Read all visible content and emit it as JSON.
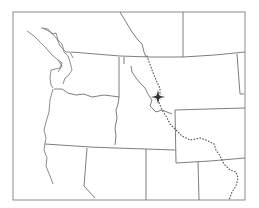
{
  "map": {
    "region": "Pacific Northwest / Northern Rocky Mountains",
    "labels": [],
    "features": {
      "frame": "map-frame",
      "international_border": "canada-us-border",
      "state_borders": [
        "washington",
        "oregon",
        "idaho",
        "montana",
        "wyoming",
        "nevada",
        "utah",
        "california"
      ],
      "continental_divide": "dotted-line",
      "marker": "compass-star"
    },
    "colors": {
      "background": "#ffffff",
      "lines": "#6e6e6e",
      "marker": "#333333"
    }
  }
}
